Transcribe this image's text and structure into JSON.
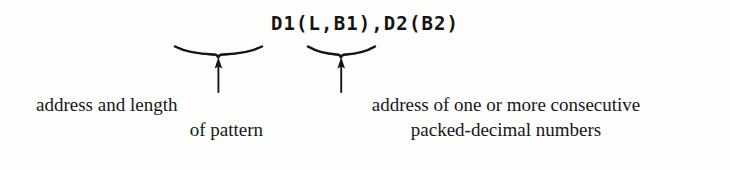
{
  "figure": {
    "syntax": "D1(L,B1),D2(B2)",
    "annotations": [
      {
        "id": "operand-1",
        "brace_label": "underbrace-operand-1",
        "arrow_label": "arrow-operand-1",
        "caption_lines": [
          "address and length",
          "of pattern"
        ]
      },
      {
        "id": "operand-2",
        "brace_label": "underbrace-operand-2",
        "arrow_label": "arrow-operand-2",
        "caption_lines": [
          "address of one or more consecutive",
          "packed-decimal numbers"
        ]
      }
    ],
    "colors": {
      "background": "#fdfdfb",
      "ink": "#141414",
      "caption_ink": "#17171a"
    }
  }
}
